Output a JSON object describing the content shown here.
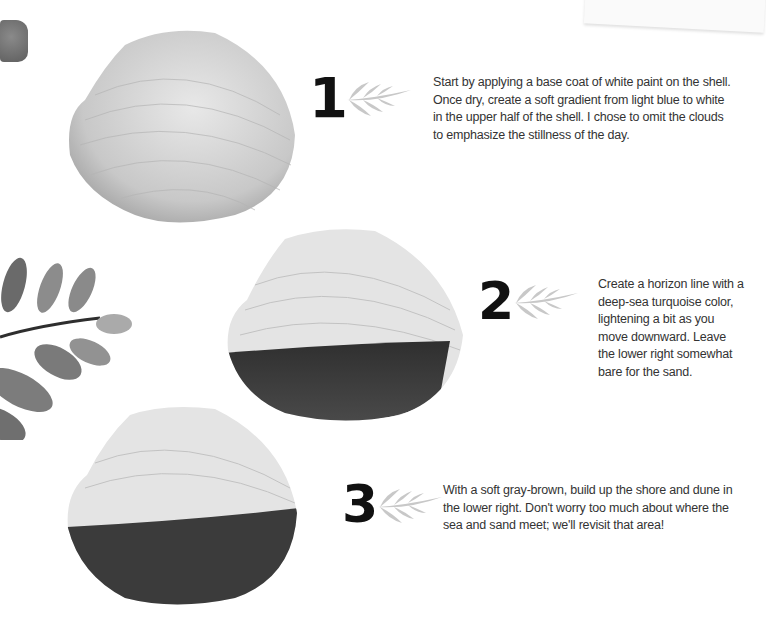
{
  "steps": [
    {
      "number": "1",
      "text": "Start by applying a base coat of white paint on the shell. Once dry, create a soft gradient from light blue to white in the upper half of the shell. I chose to omit the clouds to emphasize the stillness of the day.",
      "shell_state": "white-base"
    },
    {
      "number": "2",
      "text": "Create a horizon line with a deep-sea turquoise color, lightening a bit as you move downward. Leave the lower right somewhat bare for the sand.",
      "shell_state": "sea-painted"
    },
    {
      "number": "3",
      "text": "With a soft gray-brown, build up the shore and dune in the lower right. Don't worry too much about where the sea and sand meet; we'll revisit that area!",
      "shell_state": "sand-painted"
    }
  ],
  "colors": {
    "shell_light": "#d9d9d9",
    "sea_dark": "#3a3a3a",
    "leaf_arrow": "#c8c8c8",
    "number": "#111111",
    "text": "#333333"
  }
}
